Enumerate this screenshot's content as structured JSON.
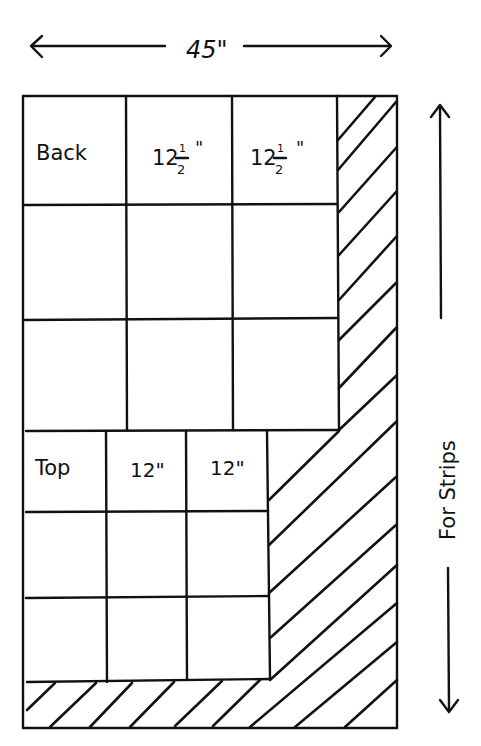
{
  "diagram": {
    "width_label": "45\"",
    "side_label": "For Strips",
    "back_section": {
      "row_label": "Back",
      "column_labels": [
        "12",
        "12"
      ],
      "fraction": {
        "numerator": "1",
        "denominator": "2"
      },
      "inch_mark": "\"",
      "rows": 3,
      "columns": 3
    },
    "top_section": {
      "row_label": "Top",
      "column_labels": [
        "12\"",
        "12\""
      ],
      "rows": 3,
      "columns": 3
    },
    "hatched_region": "strips"
  }
}
